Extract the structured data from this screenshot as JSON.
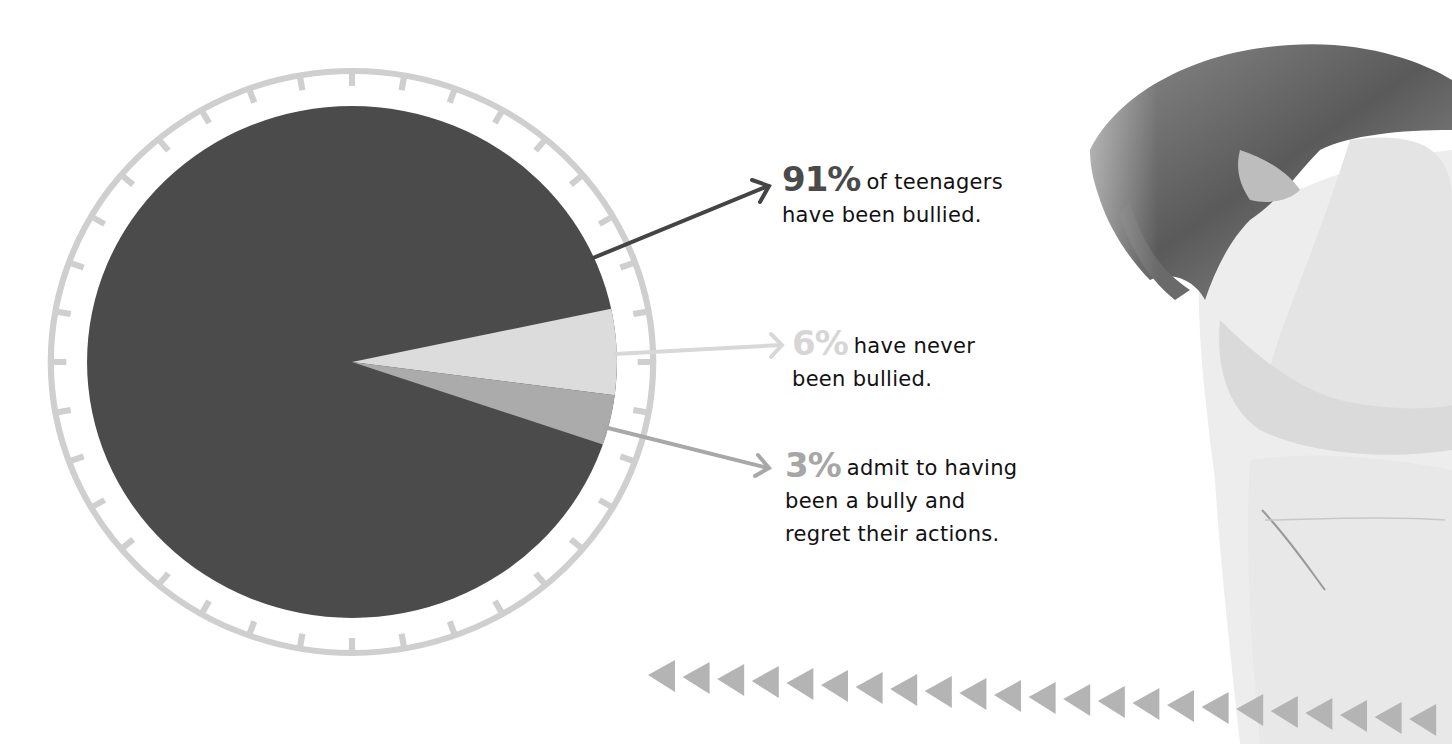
{
  "chart_data": {
    "type": "pie",
    "title": "",
    "slices": [
      {
        "label": "have been bullied",
        "value": 91,
        "color": "#4b4b4b"
      },
      {
        "label": "have never been bullied",
        "value": 6,
        "color": "#dcdcdc"
      },
      {
        "label": "admit to having been a bully and regret their actions",
        "value": 3,
        "color": "#ababab"
      }
    ],
    "ring_color": "#cfcfcf",
    "legend_position": "right"
  },
  "annotations": [
    {
      "pct": "91%",
      "line1": "of teenagers",
      "line2": "have been bullied.",
      "line3": "",
      "arrow_color": "#444444"
    },
    {
      "pct": "6%",
      "line1": "have never",
      "line2": "been bullied.",
      "line3": "",
      "arrow_color": "#d8d8d8"
    },
    {
      "pct": "3%",
      "line1": "admit to having",
      "line2": "been a bully and",
      "line3": "regret their actions.",
      "arrow_color": "#a8a8a8"
    }
  ],
  "decor": {
    "triangle_color": "#b4b4b4",
    "triangle_count": 23,
    "photo": "distressed-teen-photo"
  }
}
